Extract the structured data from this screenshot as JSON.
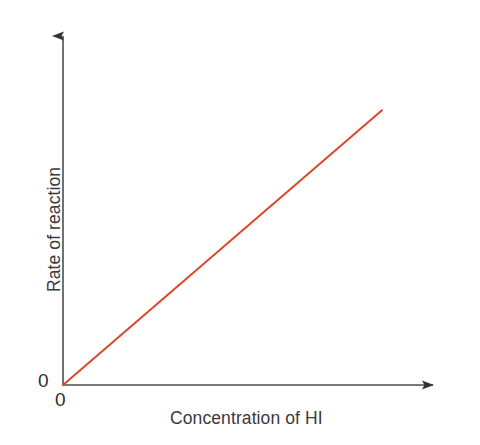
{
  "figure": {
    "width": 480,
    "height": 445,
    "background_color": "#ffffff"
  },
  "axes": {
    "origin_label_y": "0",
    "origin_label_x": "0",
    "axis_color": "#4d4d4d",
    "text_color": "#3a3a3a"
  },
  "chart_data": {
    "type": "line",
    "title": "",
    "subtitle": "",
    "xlabel": "Concentration of HI",
    "ylabel": "Rate of reaction",
    "x": [
      0,
      1
    ],
    "series": [
      {
        "name": "Rate of reaction",
        "values": [
          0,
          1
        ],
        "color": "#dd4726",
        "line_width": 2
      }
    ],
    "xlim": [
      0,
      1.16
    ],
    "ylim": [
      0,
      1.27
    ],
    "xticks": [
      "0"
    ],
    "yticks": [
      "0"
    ],
    "xtick_values": [
      0
    ],
    "ytick_values": [
      0
    ],
    "grid": false,
    "legend": false,
    "legend_position": "none",
    "annotations": [],
    "axis_style": "arrow-headed axes, no tick marks, only origin labelled 0"
  }
}
